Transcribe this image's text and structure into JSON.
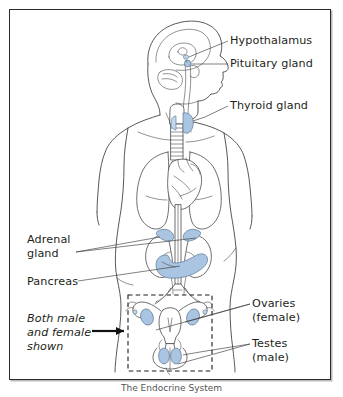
{
  "figure": {
    "title": "The Endocrine System",
    "caption": "The Endocrine System",
    "frame_border_color": "#2b2b2b",
    "background_color": "#ffffff"
  },
  "colors": {
    "gland_fill": "#a9c5e2",
    "gland_fill_light": "#c3d8ec",
    "outline": "#231f20",
    "body_outline": "#3a3a3a",
    "leader_line": "#3a3a3a",
    "text": "#231f20",
    "dashed_box": "#1a1a1a"
  },
  "labels": [
    {
      "id": "hypothalamus",
      "name": "label-hypothalamus",
      "lines": [
        "Hypothalamus"
      ],
      "x": 230,
      "y": 35,
      "italic": false
    },
    {
      "id": "pituitary-gland",
      "name": "label-pituitary-gland",
      "lines": [
        "Pituitary gland"
      ],
      "x": 230,
      "y": 58,
      "italic": false
    },
    {
      "id": "thyroid-gland",
      "name": "label-thyroid-gland",
      "lines": [
        "Thyroid gland"
      ],
      "x": 230,
      "y": 100,
      "italic": false
    },
    {
      "id": "adrenal-gland",
      "name": "label-adrenal-gland",
      "lines": [
        "Adrenal",
        "gland"
      ],
      "x": 27,
      "y": 234,
      "italic": false
    },
    {
      "id": "pancreas",
      "name": "label-pancreas",
      "lines": [
        "Pancreas"
      ],
      "x": 27,
      "y": 276,
      "italic": false
    },
    {
      "id": "both-male-and-female-shown",
      "name": "label-both-male-and-female-shown",
      "lines": [
        "Both male",
        "and female",
        "shown"
      ],
      "x": 27,
      "y": 313,
      "italic": true
    },
    {
      "id": "ovaries-female",
      "name": "label-ovaries-female",
      "lines": [
        "Ovaries",
        "(female)"
      ],
      "x": 252,
      "y": 298,
      "italic": false
    },
    {
      "id": "testes-male",
      "name": "label-testes-male",
      "lines": [
        "Testes",
        "(male)"
      ],
      "x": 252,
      "y": 338,
      "italic": false
    }
  ],
  "label_text": {
    "hypothalamus": "Hypothalamus",
    "pituitary_gland": "Pituitary gland",
    "thyroid_gland": "Thyroid gland",
    "adrenal_line1": "Adrenal",
    "adrenal_line2": "gland",
    "pancreas": "Pancreas",
    "both_line1": "Both male",
    "both_line2": "and female",
    "both_line3": "shown",
    "ovaries_line1": "Ovaries",
    "ovaries_line2": "(female)",
    "testes_line1": "Testes",
    "testes_line2": "(male)"
  },
  "anatomy": {
    "figure_orientation": "anterior body outline with head in right profile",
    "organs": [
      {
        "name": "brain",
        "highlighted": false
      },
      {
        "name": "hypothalamus",
        "highlighted": true
      },
      {
        "name": "pituitary-gland",
        "highlighted": true
      },
      {
        "name": "trachea",
        "highlighted": false
      },
      {
        "name": "thyroid-gland",
        "highlighted": true
      },
      {
        "name": "lungs",
        "highlighted": false
      },
      {
        "name": "heart",
        "highlighted": false
      },
      {
        "name": "kidneys",
        "highlighted": false
      },
      {
        "name": "adrenal-glands",
        "highlighted": true
      },
      {
        "name": "pancreas",
        "highlighted": true
      },
      {
        "name": "uterus",
        "highlighted": false
      },
      {
        "name": "ovaries",
        "highlighted": true
      },
      {
        "name": "testes",
        "highlighted": true
      }
    ],
    "dashed_box": {
      "x": 128,
      "y": 295,
      "width": 84,
      "height": 76,
      "note": "encloses reproductive organs, both male and female shown"
    }
  }
}
